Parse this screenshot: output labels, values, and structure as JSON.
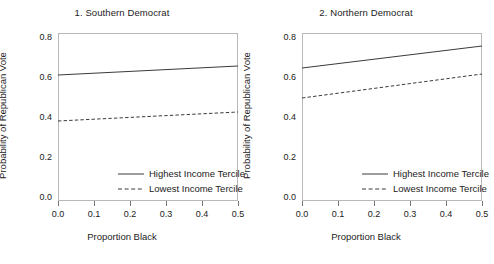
{
  "figure": {
    "width": 488,
    "height": 264,
    "background": "#ffffff",
    "line_color": "#3a3a3a",
    "frame_color": "#b9b9b9"
  },
  "chart_data": [
    {
      "type": "line",
      "title": "1. Southern Democrat",
      "xlabel": "Proportion Black",
      "ylabel": "Probability of Republican Vote",
      "xlim": [
        0.0,
        0.5
      ],
      "ylim": [
        0.0,
        0.8
      ],
      "xticks": [
        0.0,
        0.1,
        0.2,
        0.3,
        0.4,
        0.5
      ],
      "xticklabels": [
        "0.0",
        "0.1",
        "0.2",
        "0.3",
        "0.4",
        "0.5"
      ],
      "yticks": [
        0.0,
        0.2,
        0.4,
        0.6,
        0.8
      ],
      "yticklabels": [
        "0.0",
        "0.2",
        "0.4",
        "0.6",
        "0.8"
      ],
      "grid": false,
      "legend_position": "lower right",
      "x": [
        0.0,
        0.5
      ],
      "series": [
        {
          "name": "Highest Income Tercile",
          "style": "solid",
          "values": [
            0.61,
            0.655
          ]
        },
        {
          "name": "Lowest Income Tercile",
          "style": "dashed",
          "values": [
            0.38,
            0.425
          ]
        }
      ]
    },
    {
      "type": "line",
      "title": "2. Northern Democrat",
      "xlabel": "Proportion Black",
      "ylabel": "Probability of Republican Vote",
      "xlim": [
        0.0,
        0.5
      ],
      "ylim": [
        0.0,
        0.8
      ],
      "xticks": [
        0.0,
        0.1,
        0.2,
        0.3,
        0.4,
        0.5
      ],
      "xticklabels": [
        "0.0",
        "0.1",
        "0.2",
        "0.3",
        "0.4",
        "0.5"
      ],
      "yticks": [
        0.0,
        0.2,
        0.4,
        0.6,
        0.8
      ],
      "yticklabels": [
        "0.0",
        "0.2",
        "0.4",
        "0.6",
        "0.8"
      ],
      "grid": false,
      "legend_position": "lower right",
      "x": [
        0.0,
        0.5
      ],
      "series": [
        {
          "name": "Highest Income Tercile",
          "style": "solid",
          "values": [
            0.645,
            0.755
          ]
        },
        {
          "name": "Lowest Income Tercile",
          "style": "dashed",
          "values": [
            0.495,
            0.615
          ]
        }
      ]
    }
  ]
}
